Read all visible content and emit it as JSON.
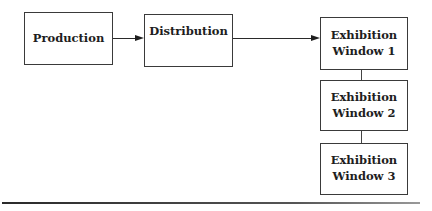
{
  "diagram": {
    "nodes": [
      {
        "id": "production",
        "label": "Production"
      },
      {
        "id": "distribution",
        "label": "Distribution"
      },
      {
        "id": "window1",
        "line1": "Exhibition",
        "line2": "Window 1"
      },
      {
        "id": "window2",
        "line1": "Exhibition",
        "line2": "Window 2"
      },
      {
        "id": "window3",
        "line1": "Exhibition",
        "line2": "Window 3"
      }
    ],
    "edges": [
      {
        "from": "production",
        "to": "distribution",
        "type": "arrow"
      },
      {
        "from": "distribution",
        "to": "window1",
        "type": "arrow"
      },
      {
        "from": "window1",
        "to": "window2",
        "type": "line"
      },
      {
        "from": "window2",
        "to": "window3",
        "type": "line"
      }
    ],
    "colors": {
      "stroke": "#3a3a3a",
      "text": "#1e1e1e",
      "background": "#ffffff"
    }
  }
}
